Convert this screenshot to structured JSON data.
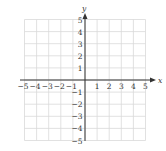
{
  "graph": {
    "x_axis_label": "x",
    "y_axis_label": "y",
    "x_range": [
      -5,
      5
    ],
    "y_range": [
      -5,
      5
    ],
    "x_ticks": [
      "−5",
      "−4",
      "−3",
      "−2",
      "−1",
      "1",
      "2",
      "3",
      "4",
      "5"
    ],
    "y_ticks_pos": [
      "1",
      "2",
      "3",
      "4",
      "5"
    ],
    "y_ticks_neg": [
      "−1",
      "−2",
      "−3",
      "−4",
      "−5"
    ],
    "grid_color": "#d9d9d9",
    "axis_color": "#333333"
  }
}
